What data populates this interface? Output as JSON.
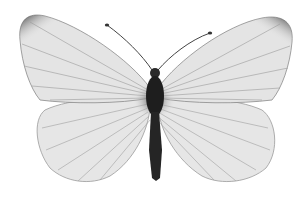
{
  "image": {
    "subject": "butterfly",
    "view": "dorsal, wings spread",
    "color_mode": "grayscale",
    "background": "#ffffff",
    "colors": {
      "wing_fill": "#e4e4e4",
      "wing_vein": "#8a8a8a",
      "wing_tip": "#3a3a3a",
      "body": "#1e1e1e",
      "hair": "#4a4a4a"
    }
  }
}
